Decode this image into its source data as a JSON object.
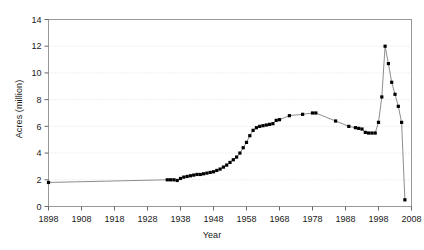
{
  "chart_data": {
    "type": "line",
    "title": "",
    "xlabel": "Year",
    "ylabel": "Acres (million)",
    "xlim": [
      1898,
      2008
    ],
    "ylim": [
      0,
      14
    ],
    "xticks": [
      1898,
      1908,
      1918,
      1928,
      1938,
      1948,
      1958,
      1968,
      1978,
      1988,
      1998,
      2008
    ],
    "yticks": [
      0,
      2,
      4,
      6,
      8,
      10,
      12,
      14
    ],
    "xtick_labels": [
      "1898",
      "1908",
      "1918",
      "1928",
      "1938",
      "1948",
      "1958",
      "1968",
      "1978",
      "1988",
      "1998",
      "2008"
    ],
    "ytick_labels": [
      "0",
      "2",
      "4",
      "6",
      "8",
      "10",
      "12",
      "14"
    ],
    "grid": true,
    "grid_axis": "y",
    "legend": false,
    "marker": "square",
    "marker_color": "#000000",
    "line_color": "#808080",
    "frame_color": "#999999",
    "series": [
      {
        "name": "Acres",
        "x": [
          1898,
          1934,
          1935,
          1936,
          1937,
          1938,
          1939,
          1940,
          1941,
          1942,
          1943,
          1944,
          1945,
          1946,
          1947,
          1948,
          1949,
          1950,
          1951,
          1952,
          1953,
          1954,
          1955,
          1956,
          1957,
          1958,
          1959,
          1960,
          1961,
          1962,
          1963,
          1964,
          1965,
          1966,
          1967,
          1968,
          1971,
          1975,
          1978,
          1979,
          1985,
          1989,
          1991,
          1992,
          1993,
          1994,
          1995,
          1996,
          1997,
          1998,
          1999,
          2000,
          2001,
          2002,
          2003,
          2004,
          2005,
          2006
        ],
        "values": [
          1.8,
          2.0,
          2.0,
          2.0,
          1.95,
          2.1,
          2.2,
          2.25,
          2.3,
          2.35,
          2.4,
          2.4,
          2.45,
          2.5,
          2.55,
          2.6,
          2.7,
          2.8,
          2.95,
          3.1,
          3.3,
          3.5,
          3.7,
          4.0,
          4.4,
          4.8,
          5.3,
          5.7,
          5.9,
          6.0,
          6.05,
          6.1,
          6.15,
          6.2,
          6.45,
          6.5,
          6.8,
          6.9,
          7.0,
          7.0,
          6.4,
          6.0,
          5.9,
          5.85,
          5.8,
          5.55,
          5.5,
          5.5,
          5.5,
          6.3,
          8.2,
          12.0,
          10.7,
          9.3,
          8.4,
          7.5,
          6.3,
          0.5
        ]
      }
    ]
  }
}
